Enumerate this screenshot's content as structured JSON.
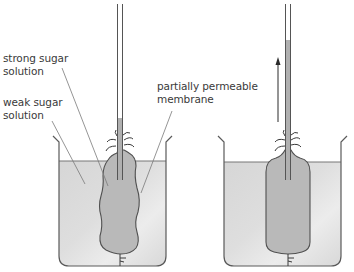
{
  "diagram": {
    "colors": {
      "outline": "#5a5a5a",
      "label_line": "#7a7a7a",
      "weak_solution": "#dcdcdc",
      "strong_solution": "#b8b8b8",
      "tube_fill": "#b0b0b0",
      "arrow": "#2a2a2a"
    },
    "labels": {
      "strong_sugar_solution": {
        "line1": "strong sugar",
        "line2": "solution"
      },
      "weak_sugar_solution": {
        "line1": "weak sugar",
        "line2": "solution"
      },
      "partially_permeable_membrane": {
        "line1": "partially permeable",
        "line2": "membrane"
      }
    },
    "panels": [
      {
        "name": "before",
        "tube_liquid_top_y": 118,
        "arrow": false
      },
      {
        "name": "after",
        "tube_liquid_top_y": 40,
        "arrow": true,
        "arrow_direction": "up"
      }
    ]
  }
}
